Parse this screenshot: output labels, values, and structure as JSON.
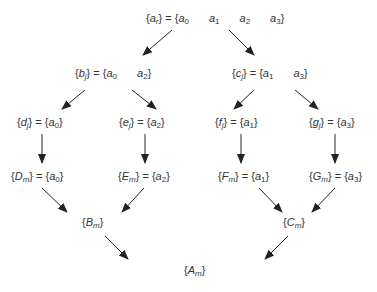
{
  "nodes": {
    "root": {
      "lhs": "a",
      "lhs_sub": "r",
      "elements": [
        {
          "v": "a",
          "s": "0"
        },
        {
          "v": "a",
          "s": "1"
        },
        {
          "v": "a",
          "s": "2"
        },
        {
          "v": "a",
          "s": "3"
        }
      ]
    },
    "b": {
      "lhs": "b",
      "lhs_sub": "j",
      "elements": [
        {
          "v": "a",
          "s": "0"
        },
        {
          "v": "a",
          "s": "2"
        }
      ]
    },
    "c": {
      "lhs": "c",
      "lhs_sub": "j",
      "elements": [
        {
          "v": "a",
          "s": "1"
        },
        {
          "v": "a",
          "s": "3"
        }
      ]
    },
    "d": {
      "lhs": "d",
      "lhs_sub": "j",
      "elements": [
        {
          "v": "a",
          "s": "0"
        }
      ]
    },
    "e": {
      "lhs": "e",
      "lhs_sub": "j",
      "elements": [
        {
          "v": "a",
          "s": "2"
        }
      ]
    },
    "f": {
      "lhs": "f",
      "lhs_sub": "j",
      "elements": [
        {
          "v": "a",
          "s": "1"
        }
      ]
    },
    "g": {
      "lhs": "g",
      "lhs_sub": "j",
      "elements": [
        {
          "v": "a",
          "s": "3"
        }
      ]
    },
    "D": {
      "lhs": "D",
      "lhs_sub": "m",
      "elements": [
        {
          "v": "a",
          "s": "0"
        }
      ]
    },
    "E": {
      "lhs": "E",
      "lhs_sub": "m",
      "elements": [
        {
          "v": "a",
          "s": "2"
        }
      ]
    },
    "F": {
      "lhs": "F",
      "lhs_sub": "m",
      "elements": [
        {
          "v": "a",
          "s": "1"
        }
      ]
    },
    "G": {
      "lhs": "G",
      "lhs_sub": "m",
      "elements": [
        {
          "v": "a",
          "s": "3"
        }
      ]
    },
    "B": {
      "lhs": "B",
      "lhs_sub": "m"
    },
    "C": {
      "lhs": "C",
      "lhs_sub": "m"
    },
    "A": {
      "lhs": "A",
      "lhs_sub": "m"
    }
  },
  "labels": {
    "root": "{a_r} = {a0 a1 a2 a3}",
    "b": "{b_j} = {a0 a2}",
    "c": "{c_j} = {a1 a3}",
    "d": "{d_j} = {a0}",
    "e": "{e_j} = {a2}",
    "f": "{f_j} = {a1}",
    "g": "{g_j} = {a3}",
    "D": "{D_m} = {a0}",
    "E": "{E_m} = {a2}",
    "F": "{F_m} = {a1}",
    "G": "{G_m} = {a3}",
    "B": "{B_m}",
    "C": "{C_m}",
    "A": "{A_m}"
  },
  "edges": [
    [
      "root",
      "b"
    ],
    [
      "root",
      "c"
    ],
    [
      "b",
      "d"
    ],
    [
      "b",
      "e"
    ],
    [
      "c",
      "f"
    ],
    [
      "c",
      "g"
    ],
    [
      "d",
      "D"
    ],
    [
      "e",
      "E"
    ],
    [
      "f",
      "F"
    ],
    [
      "g",
      "G"
    ],
    [
      "D",
      "B"
    ],
    [
      "E",
      "B"
    ],
    [
      "F",
      "C"
    ],
    [
      "G",
      "C"
    ],
    [
      "B",
      "A"
    ],
    [
      "C",
      "A"
    ]
  ],
  "colors": {
    "text": "#333333",
    "arrow": "#222222",
    "background": "#ffffff"
  }
}
